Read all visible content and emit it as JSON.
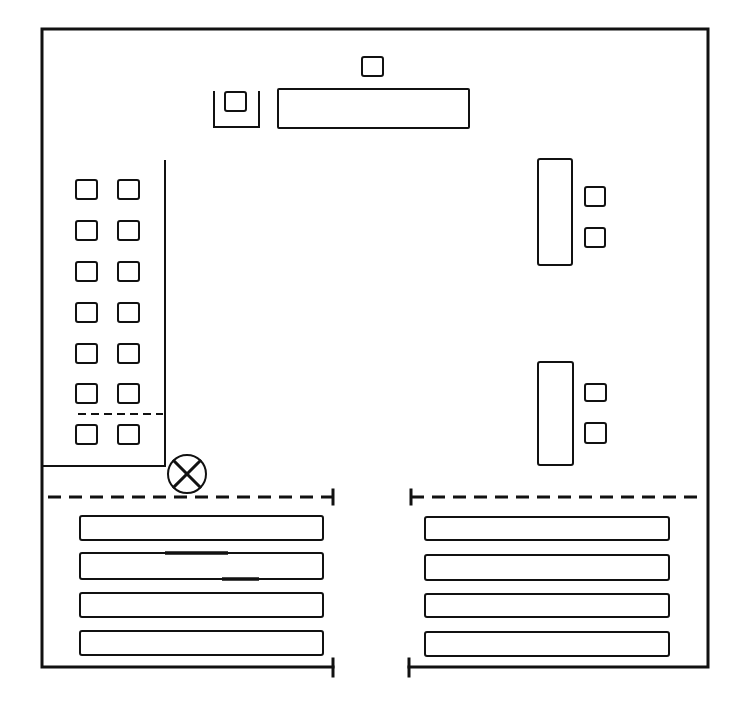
{
  "diagram": {
    "type": "floor-plan",
    "colors": {
      "line": "#111111",
      "background": "#ffffff"
    },
    "outer_wall": {
      "path": "M333 667 L42 667 L42 29 L708 29 L708 667 L409 667",
      "ticks": [
        {
          "x": 333,
          "y1": 659,
          "y2": 676
        },
        {
          "x": 409,
          "y1": 659,
          "y2": 676
        }
      ]
    },
    "top_area": {
      "small_box": {
        "x": 362,
        "y": 57,
        "w": 21,
        "h": 19
      },
      "u_enclosure": {
        "path": "M214 91 L214 127 L259 127 L259 91"
      },
      "u_inner_box": {
        "x": 225,
        "y": 92,
        "w": 21,
        "h": 19
      },
      "long_table": {
        "x": 278,
        "y": 89,
        "w": 191,
        "h": 39
      }
    },
    "left_room": {
      "partition": {
        "path": "M165 160 L165 466 L42 466"
      },
      "inner_dashed_line": {
        "x1": 78,
        "x2": 163,
        "y": 414
      },
      "box_columns_x": [
        76,
        118
      ],
      "box_rows_y": [
        180,
        221,
        262,
        303,
        344,
        384,
        425
      ],
      "box_size": {
        "w": 21,
        "h": 19
      }
    },
    "symbol_cross_circle": {
      "cx": 187,
      "cy": 474,
      "r": 19,
      "label": "cross-circle-symbol"
    },
    "divider_dashed": [
      {
        "x1": 48,
        "x2": 333,
        "y": 497,
        "tick_x": 333
      },
      {
        "x1": 411,
        "x2": 702,
        "y": 497,
        "tick_x": 411
      }
    ],
    "benches_left": {
      "x": 80,
      "w": 243,
      "rows": [
        {
          "y": 516,
          "h": 24
        },
        {
          "y": 553,
          "h": 26
        },
        {
          "y": 593,
          "h": 24
        },
        {
          "y": 631,
          "h": 24
        }
      ]
    },
    "benches_right": {
      "x": 425,
      "w": 244,
      "rows": [
        {
          "y": 517,
          "h": 23
        },
        {
          "y": 555,
          "h": 25
        },
        {
          "y": 594,
          "h": 23
        },
        {
          "y": 632,
          "h": 24
        }
      ]
    },
    "bench_marks": [
      {
        "x1": 165,
        "x2": 228,
        "y": 553
      },
      {
        "x1": 222,
        "x2": 259,
        "y": 579
      }
    ],
    "right_desks": [
      {
        "desk": {
          "x": 538,
          "y": 159,
          "w": 34,
          "h": 106
        },
        "chairs": [
          {
            "x": 585,
            "y": 187,
            "w": 20,
            "h": 19
          },
          {
            "x": 585,
            "y": 228,
            "w": 20,
            "h": 19
          }
        ]
      },
      {
        "desk": {
          "x": 538,
          "y": 362,
          "w": 35,
          "h": 103
        },
        "chairs": [
          {
            "x": 585,
            "y": 384,
            "w": 21,
            "h": 17
          },
          {
            "x": 585,
            "y": 423,
            "w": 21,
            "h": 20
          }
        ]
      }
    ]
  }
}
